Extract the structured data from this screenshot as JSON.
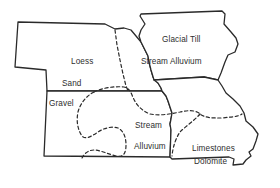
{
  "map": {
    "type": "soil-parent-material-map",
    "regions": [
      {
        "id": "nebraska",
        "kind": "state-outline"
      },
      {
        "id": "iowa",
        "kind": "state-outline"
      },
      {
        "id": "kansas",
        "kind": "state-outline"
      },
      {
        "id": "missouri",
        "kind": "state-outline"
      }
    ],
    "labels": {
      "loess": "Loess",
      "sand": "Sand",
      "gravel": "Gravel",
      "glacial_till": "Glacial Till",
      "stream_alluvium_north": "Stream Alluvium",
      "stream": "Stream",
      "alluvium": "Alluvium",
      "limestones": "Limestones",
      "dolomite": "Dolomite"
    },
    "colors": {
      "outline": "#2a2a2a",
      "background": "#ffffff",
      "text": "#2e2e2e"
    }
  }
}
